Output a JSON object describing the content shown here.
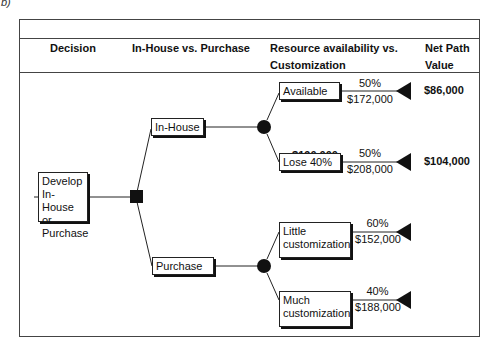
{
  "figure_mark": "b)",
  "header": {
    "col1": "Decision",
    "col2": "In-House vs. Purchase",
    "col3": "Resource availability vs. Customization",
    "col4": "Net Path Value"
  },
  "tree": {
    "root": {
      "label": "Develop In-House or Purchase",
      "node_type": "decision"
    },
    "branches": [
      {
        "label": "In-House",
        "node_type": "chance",
        "expected_value": "$190,000",
        "outcomes": [
          {
            "label": "Available",
            "probability": "50%",
            "cost": "$172,000",
            "net_path_value": "$86,000"
          },
          {
            "label": "Lose 40%",
            "probability": "50%",
            "cost": "$208,000",
            "net_path_value": "$104,000"
          }
        ]
      },
      {
        "label": "Purchase",
        "node_type": "chance",
        "outcomes": [
          {
            "label": "Little customization",
            "probability": "60%",
            "cost": "$152,000"
          },
          {
            "label": "Much customization",
            "probability": "40%",
            "cost": "$188,000"
          }
        ]
      }
    ]
  },
  "colors": {
    "line": "#222222",
    "node_fill": "#111111",
    "frame": "#444444"
  }
}
